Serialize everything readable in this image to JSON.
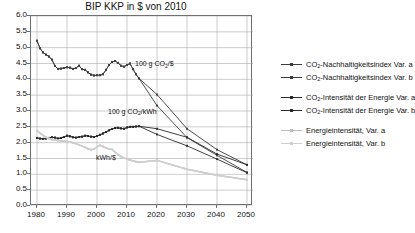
{
  "chart_data": {
    "type": "line",
    "title": "BIP KKP in $ von 2010",
    "xlabel": "",
    "ylabel": "",
    "xlim": [
      1978,
      2052
    ],
    "ylim": [
      0.0,
      6.0
    ],
    "grid": true,
    "legend_position": "right",
    "xticks": [
      "1980",
      "1990",
      "2000",
      "2010",
      "2020",
      "2030",
      "2040",
      "2050"
    ],
    "xtick_values": [
      1980,
      1990,
      2000,
      2010,
      2020,
      2030,
      2040,
      2050
    ],
    "yticks": [
      "0.0",
      "0.5",
      "1.0",
      "1.5",
      "2.0",
      "2.5",
      "3.0",
      "3.5",
      "4.0",
      "4.5",
      "5.0",
      "5.5",
      "6.0"
    ],
    "ytick_values": [
      0.0,
      0.5,
      1.0,
      1.5,
      2.0,
      2.5,
      3.0,
      3.5,
      4.0,
      4.5,
      5.0,
      5.5,
      6.0
    ],
    "annotations": [
      {
        "id": "annot-co2-per-dollar",
        "text": "100 g CO₂/$",
        "x": 2013,
        "y": 4.45
      },
      {
        "id": "annot-co2-per-kwh",
        "text": "100 g CO₂/kWh",
        "x": 2004,
        "y": 2.95
      },
      {
        "id": "annot-kwh-per-dollar",
        "text": "kWh/$",
        "x": 2000,
        "y": 1.5
      }
    ],
    "series": [
      {
        "name": "CO₂-Nachhaltigkeitsindex Var. a",
        "short": "co2-nachhaltigkeitsindex-var-a",
        "color": "#3c3c3c",
        "marker": "square",
        "x": [
          1980,
          1981,
          1982,
          1983,
          1984,
          1985,
          1986,
          1987,
          1988,
          1989,
          1990,
          1991,
          1992,
          1993,
          1994,
          1995,
          1996,
          1997,
          1998,
          1999,
          2000,
          2001,
          2002,
          2003,
          2004,
          2005,
          2006,
          2007,
          2008,
          2009,
          2010,
          2011,
          2012,
          2013,
          2014,
          2020,
          2030,
          2040,
          2050
        ],
        "y": [
          5.22,
          4.98,
          4.85,
          4.78,
          4.72,
          4.62,
          4.42,
          4.33,
          4.34,
          4.36,
          4.38,
          4.37,
          4.33,
          4.36,
          4.43,
          4.32,
          4.3,
          4.22,
          4.15,
          4.12,
          4.13,
          4.13,
          4.16,
          4.3,
          4.45,
          4.55,
          4.58,
          4.52,
          4.43,
          4.4,
          4.45,
          4.5,
          4.32,
          4.16,
          4.03,
          3.17,
          2.16,
          1.6,
          1.06
        ]
      },
      {
        "name": "CO₂-Nachhaltigkeitsindex Var. b",
        "short": "co2-nachhaltigkeitsindex-var-b",
        "color": "#3c3c3c",
        "marker": "square",
        "x": [
          1980,
          1981,
          1982,
          1983,
          1984,
          1985,
          1986,
          1987,
          1988,
          1989,
          1990,
          1991,
          1992,
          1993,
          1994,
          1995,
          1996,
          1997,
          1998,
          1999,
          2000,
          2001,
          2002,
          2003,
          2004,
          2005,
          2006,
          2007,
          2008,
          2009,
          2010,
          2011,
          2012,
          2013,
          2014,
          2020,
          2030,
          2040,
          2050
        ],
        "y": [
          5.22,
          4.98,
          4.85,
          4.78,
          4.72,
          4.62,
          4.42,
          4.33,
          4.34,
          4.36,
          4.38,
          4.37,
          4.33,
          4.36,
          4.43,
          4.32,
          4.3,
          4.22,
          4.15,
          4.12,
          4.13,
          4.13,
          4.16,
          4.3,
          4.45,
          4.55,
          4.58,
          4.52,
          4.43,
          4.4,
          4.45,
          4.5,
          4.32,
          4.16,
          4.03,
          3.52,
          2.44,
          1.78,
          1.3
        ]
      },
      {
        "name": "CO₂-Intensität der Energie Var. a",
        "short": "co2-intensitaet-der-energie-var-a",
        "color": "#2b2b2b",
        "marker": "square",
        "x": [
          1980,
          1981,
          1982,
          1983,
          1984,
          1985,
          1986,
          1987,
          1988,
          1989,
          1990,
          1991,
          1992,
          1993,
          1994,
          1995,
          1996,
          1997,
          1998,
          1999,
          2000,
          2001,
          2002,
          2003,
          2004,
          2005,
          2006,
          2007,
          2008,
          2009,
          2010,
          2011,
          2012,
          2013,
          2014,
          2020,
          2030,
          2040,
          2050
        ],
        "y": [
          2.15,
          2.13,
          2.12,
          2.13,
          2.15,
          2.17,
          2.16,
          2.13,
          2.15,
          2.18,
          2.22,
          2.2,
          2.17,
          2.16,
          2.18,
          2.19,
          2.22,
          2.21,
          2.19,
          2.18,
          2.21,
          2.25,
          2.29,
          2.34,
          2.39,
          2.43,
          2.46,
          2.47,
          2.45,
          2.44,
          2.48,
          2.5,
          2.5,
          2.51,
          2.52,
          2.26,
          1.9,
          1.48,
          1.05
        ]
      },
      {
        "name": "CO₂-Intensität der Energie Var. b",
        "short": "co2-intensitaet-der-energie-var-b",
        "color": "#2b2b2b",
        "marker": "square",
        "x": [
          1980,
          1981,
          1982,
          1983,
          1984,
          1985,
          1986,
          1987,
          1988,
          1989,
          1990,
          1991,
          1992,
          1993,
          1994,
          1995,
          1996,
          1997,
          1998,
          1999,
          2000,
          2001,
          2002,
          2003,
          2004,
          2005,
          2006,
          2007,
          2008,
          2009,
          2010,
          2011,
          2012,
          2013,
          2014,
          2020,
          2030,
          2040,
          2050
        ],
        "y": [
          2.15,
          2.13,
          2.12,
          2.13,
          2.15,
          2.17,
          2.16,
          2.13,
          2.15,
          2.18,
          2.22,
          2.2,
          2.17,
          2.16,
          2.18,
          2.19,
          2.22,
          2.21,
          2.19,
          2.18,
          2.21,
          2.25,
          2.29,
          2.34,
          2.39,
          2.43,
          2.46,
          2.47,
          2.45,
          2.44,
          2.48,
          2.5,
          2.5,
          2.51,
          2.52,
          2.44,
          2.17,
          1.64,
          1.3
        ]
      },
      {
        "name": "Energieintensität, Var. a",
        "short": "energieintensitaet-var-a",
        "color": "#bcbcbc",
        "marker": "square",
        "x": [
          1980,
          1981,
          1982,
          1983,
          1984,
          1985,
          1986,
          1987,
          1988,
          1989,
          1990,
          1991,
          1992,
          1993,
          1994,
          1995,
          1996,
          1997,
          1998,
          1999,
          2000,
          2001,
          2002,
          2003,
          2004,
          2005,
          2006,
          2007,
          2008,
          2009,
          2010,
          2011,
          2012,
          2013,
          2014,
          2020,
          2030,
          2040,
          2050
        ],
        "y": [
          2.38,
          2.3,
          2.23,
          2.17,
          2.13,
          2.1,
          2.08,
          2.07,
          2.06,
          2.05,
          2.04,
          2.02,
          2.0,
          1.97,
          1.93,
          1.89,
          1.85,
          1.81,
          1.78,
          1.8,
          1.87,
          1.92,
          1.88,
          1.83,
          1.8,
          1.79,
          1.7,
          1.62,
          1.56,
          1.52,
          1.48,
          1.45,
          1.42,
          1.4,
          1.38,
          1.44,
          1.16,
          0.97,
          0.83
        ]
      },
      {
        "name": "Energieintensität, Var. b",
        "short": "energieintensitaet-var-b",
        "color": "#cfcfcf",
        "marker": "square",
        "x": [
          1980,
          1981,
          1982,
          1983,
          1984,
          1985,
          1986,
          1987,
          1988,
          1989,
          1990,
          1991,
          1992,
          1993,
          1994,
          1995,
          1996,
          1997,
          1998,
          1999,
          2000,
          2001,
          2002,
          2003,
          2004,
          2005,
          2006,
          2007,
          2008,
          2009,
          2010,
          2011,
          2012,
          2013,
          2014,
          2020,
          2030,
          2040,
          2050
        ],
        "y": [
          2.38,
          2.3,
          2.23,
          2.17,
          2.13,
          2.1,
          2.08,
          2.07,
          2.06,
          2.05,
          2.04,
          2.02,
          2.0,
          1.97,
          1.93,
          1.89,
          1.85,
          1.81,
          1.78,
          1.8,
          1.87,
          1.92,
          1.88,
          1.83,
          1.8,
          1.79,
          1.7,
          1.62,
          1.56,
          1.52,
          1.48,
          1.45,
          1.42,
          1.4,
          1.38,
          1.44,
          1.16,
          0.97,
          0.83
        ]
      }
    ]
  },
  "legend": {
    "groups": [
      {
        "id": "group-nachhaltigkeitsindex",
        "rows": [
          {
            "label_html": "CO<sub>2</sub>-Nachhaltigkeitsindex Var. a",
            "series": 0
          },
          {
            "label_html": "CO<sub>2</sub>-Nachhaltigkeitsindex Var. b",
            "series": 1
          }
        ]
      },
      {
        "id": "group-co2-intensitaet",
        "rows": [
          {
            "label_html": "CO<sub>2</sub>-Intensität der Energie Var. a",
            "series": 2
          },
          {
            "label_html": "CO<sub>2</sub>-Intensität der Energie Var. b",
            "series": 3
          }
        ]
      },
      {
        "id": "group-energieintensitaet",
        "rows": [
          {
            "label_html": "Energieintensität, Var. a",
            "series": 4
          },
          {
            "label_html": "Energieintensität, Var. b",
            "series": 5
          }
        ]
      }
    ]
  },
  "colors": {
    "axis": "#6f6f6f",
    "grid": "#9a9a9a",
    "text": "#111111",
    "background": "#ffffff"
  }
}
